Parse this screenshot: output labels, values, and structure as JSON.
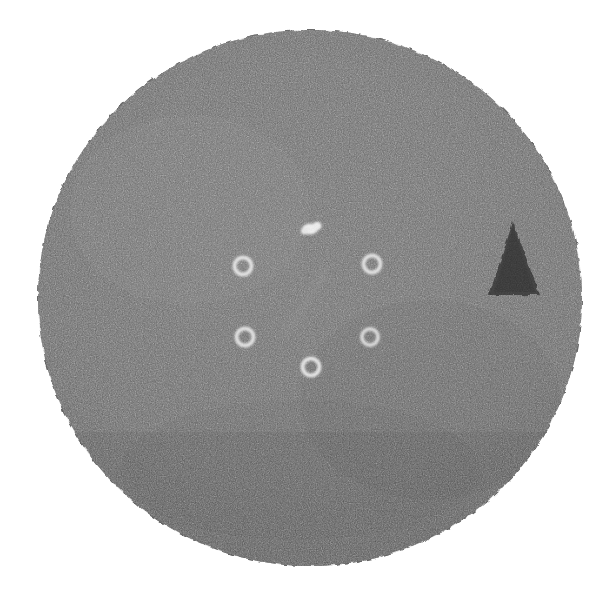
{
  "image": {
    "kind": "grayscale-circular-field-radiograph",
    "width": 612,
    "height": 599,
    "background_color": "#ffffff",
    "alt_text": "Grainy grayscale circular field containing five bright rings, one bright solid blob and one dark triangular marker",
    "caption": ""
  },
  "field": {
    "name": "circular-field",
    "shape": "circle",
    "center_x": 310,
    "center_y": 298,
    "radius_x": 272,
    "radius_y": 268,
    "fill_color": "#6b6b6b",
    "fill_color_lower": "#636363",
    "edge_color": "#5e5e5e",
    "grain": "fine speckle noise",
    "grain_opacity": 0.55
  },
  "markers": {
    "rings": [
      {
        "label": "ring-upper-left",
        "cx": 243,
        "cy": 266,
        "r_outer": 10.5,
        "stroke_width": 4.0,
        "color": "#e6e6e6"
      },
      {
        "label": "ring-upper-right",
        "cx": 372,
        "cy": 264,
        "r_outer": 10.5,
        "stroke_width": 4.0,
        "color": "#e3e3e3"
      },
      {
        "label": "ring-lower-left",
        "cx": 245,
        "cy": 337,
        "r_outer": 10.5,
        "stroke_width": 4.0,
        "color": "#e4e4e4"
      },
      {
        "label": "ring-lower-right",
        "cx": 370,
        "cy": 337,
        "r_outer": 10.0,
        "stroke_width": 3.8,
        "color": "#dedede"
      },
      {
        "label": "ring-bottom",
        "cx": 311,
        "cy": 367,
        "r_outer": 10.5,
        "stroke_width": 4.0,
        "color": "#e8e8e8"
      }
    ],
    "blob": {
      "label": "bright-blob-top-center",
      "cx": 312,
      "cy": 228,
      "rx": 8.5,
      "ry": 5.5,
      "color": "#f2f2f2"
    },
    "triangle": {
      "label": "dark-triangle-marker",
      "apex_x": 513,
      "apex_y": 222,
      "base_left_x": 489,
      "base_right_x": 540,
      "base_y": 295,
      "color": "#3a3a3a"
    },
    "streak": {
      "label": "faint-diagonal-streak",
      "x1": 320,
      "y1": 280,
      "x2": 288,
      "y2": 330,
      "color": "#8a8a8a",
      "opacity": 0.35
    }
  },
  "counts": {
    "rings": 5,
    "blobs": 1,
    "triangles": 1
  }
}
